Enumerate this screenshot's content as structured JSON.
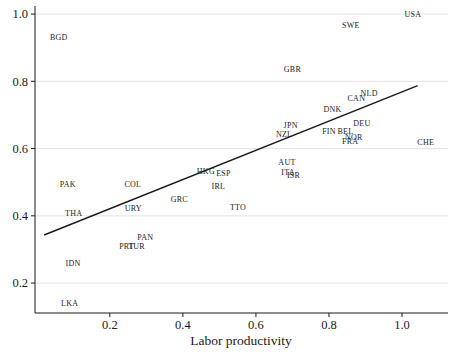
{
  "chart_data": {
    "type": "scatter",
    "marker_style": "country-code-text-labels",
    "title": "",
    "xlabel": "Labor productivity",
    "ylabel": "",
    "xlim": [
      -0.005,
      1.126
    ],
    "ylim": [
      0.111,
      1.024
    ],
    "xticks": [
      0.2,
      0.4,
      0.6,
      0.8,
      1.0
    ],
    "yticks": [
      0.2,
      0.4,
      0.6,
      0.8,
      1.0
    ],
    "grid": "horizontal-only",
    "grid_color": "#e3e3e3",
    "axis_color": "#1a1a1a",
    "fit_line": {
      "x1": 0.02,
      "y1": 0.343,
      "x2": 1.043,
      "y2": 0.787
    },
    "points": [
      {
        "label": "USA",
        "x": 1.03,
        "y": 1.0
      },
      {
        "label": "SWE",
        "x": 0.86,
        "y": 0.965
      },
      {
        "label": "BGD",
        "x": 0.06,
        "y": 0.93
      },
      {
        "label": "GBR",
        "x": 0.7,
        "y": 0.835
      },
      {
        "label": "NLD",
        "x": 0.91,
        "y": 0.765
      },
      {
        "label": "CAN",
        "x": 0.875,
        "y": 0.748
      },
      {
        "label": "DNK",
        "x": 0.81,
        "y": 0.715
      },
      {
        "label": "DEU",
        "x": 0.89,
        "y": 0.675
      },
      {
        "label": "JPN",
        "x": 0.695,
        "y": 0.67
      },
      {
        "label": "FIN",
        "x": 0.8,
        "y": 0.65
      },
      {
        "label": "BEL",
        "x": 0.845,
        "y": 0.65
      },
      {
        "label": "NZL",
        "x": 0.677,
        "y": 0.643
      },
      {
        "label": "NOR",
        "x": 0.868,
        "y": 0.633
      },
      {
        "label": "FRA",
        "x": 0.858,
        "y": 0.621
      },
      {
        "label": "CHE",
        "x": 1.065,
        "y": 0.617
      },
      {
        "label": "AUT",
        "x": 0.685,
        "y": 0.558
      },
      {
        "label": "HKG",
        "x": 0.463,
        "y": 0.531
      },
      {
        "label": "ITA",
        "x": 0.688,
        "y": 0.529
      },
      {
        "label": "ESP",
        "x": 0.511,
        "y": 0.526
      },
      {
        "label": "ISR",
        "x": 0.703,
        "y": 0.519
      },
      {
        "label": "PAK",
        "x": 0.085,
        "y": 0.493
      },
      {
        "label": "COL",
        "x": 0.263,
        "y": 0.493
      },
      {
        "label": "IRL",
        "x": 0.497,
        "y": 0.486
      },
      {
        "label": "GRC",
        "x": 0.39,
        "y": 0.449
      },
      {
        "label": "TTO",
        "x": 0.551,
        "y": 0.426
      },
      {
        "label": "URY",
        "x": 0.264,
        "y": 0.421
      },
      {
        "label": "THA",
        "x": 0.101,
        "y": 0.408
      },
      {
        "label": "PAN",
        "x": 0.297,
        "y": 0.337
      },
      {
        "label": "PRT",
        "x": 0.246,
        "y": 0.309
      },
      {
        "label": "TUR",
        "x": 0.273,
        "y": 0.308
      },
      {
        "label": "IDN",
        "x": 0.099,
        "y": 0.259
      },
      {
        "label": "LKA",
        "x": 0.09,
        "y": 0.138
      }
    ]
  }
}
